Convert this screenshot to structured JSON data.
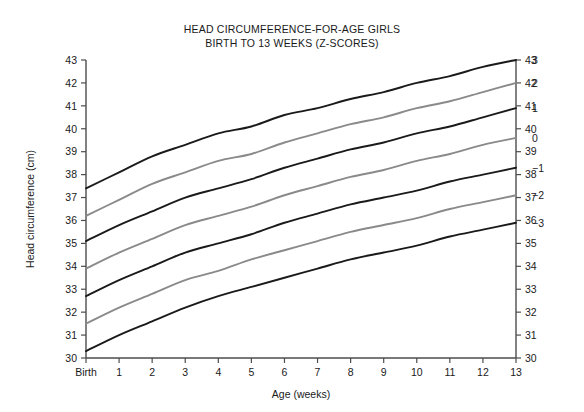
{
  "chart_data": {
    "type": "line",
    "title": "HEAD CIRCUMFERENCE-FOR-AGE GIRLS",
    "subtitle": "BIRTH TO 13 WEEKS (Z-SCORES)",
    "xlabel": "Age (weeks)",
    "ylabel": "Head circumference (cm)",
    "ylabel_right": "",
    "grid": false,
    "legend_position": "right-curve-ends",
    "xlim": [
      0,
      13
    ],
    "ylim": [
      30,
      43
    ],
    "x_tick_labels": [
      "Birth",
      "1",
      "2",
      "3",
      "4",
      "5",
      "6",
      "7",
      "8",
      "9",
      "10",
      "11",
      "12",
      "13"
    ],
    "x": [
      0,
      1,
      2,
      3,
      4,
      5,
      6,
      7,
      8,
      9,
      10,
      11,
      12,
      13
    ],
    "y_tick_labels": [
      "30",
      "31",
      "32",
      "33",
      "34",
      "35",
      "36",
      "37",
      "38",
      "39",
      "40",
      "41",
      "42",
      "43"
    ],
    "y_ticks": [
      30,
      31,
      32,
      33,
      34,
      35,
      36,
      37,
      38,
      39,
      40,
      41,
      42,
      43
    ],
    "y_tick_labels_right": [
      "30",
      "31",
      "32",
      "33",
      "34",
      "35",
      "36",
      "37",
      "38",
      "39",
      "40",
      "41",
      "42",
      "43"
    ],
    "series": [
      {
        "name": "3",
        "label": "3",
        "color": "#1a1a1a",
        "values": [
          37.4,
          38.1,
          38.8,
          39.3,
          39.8,
          40.1,
          40.6,
          40.9,
          41.3,
          41.6,
          42.0,
          42.3,
          42.7,
          43.0
        ]
      },
      {
        "name": "2",
        "label": "2",
        "color": "#8a8a8a",
        "values": [
          36.2,
          36.9,
          37.6,
          38.1,
          38.6,
          38.9,
          39.4,
          39.8,
          40.2,
          40.5,
          40.9,
          41.2,
          41.6,
          42.0
        ]
      },
      {
        "name": "1",
        "label": "1",
        "color": "#1a1a1a",
        "values": [
          35.1,
          35.8,
          36.4,
          37.0,
          37.4,
          37.8,
          38.3,
          38.7,
          39.1,
          39.4,
          39.8,
          40.1,
          40.5,
          40.9
        ]
      },
      {
        "name": "0",
        "label": "0",
        "color": "#8a8a8a",
        "values": [
          33.9,
          34.6,
          35.2,
          35.8,
          36.2,
          36.6,
          37.1,
          37.5,
          37.9,
          38.2,
          38.6,
          38.9,
          39.3,
          39.6
        ]
      },
      {
        "name": "-1",
        "label": "−1",
        "color": "#1a1a1a",
        "values": [
          32.7,
          33.4,
          34.0,
          34.6,
          35.0,
          35.4,
          35.9,
          36.3,
          36.7,
          37.0,
          37.3,
          37.7,
          38.0,
          38.3
        ]
      },
      {
        "name": "-2",
        "label": "−2",
        "color": "#8a8a8a",
        "values": [
          31.5,
          32.2,
          32.8,
          33.4,
          33.8,
          34.3,
          34.7,
          35.1,
          35.5,
          35.8,
          36.1,
          36.5,
          36.8,
          37.1
        ]
      },
      {
        "name": "-3",
        "label": "−3",
        "color": "#1a1a1a",
        "values": [
          30.3,
          31.0,
          31.6,
          32.2,
          32.7,
          33.1,
          33.5,
          33.9,
          34.3,
          34.6,
          34.9,
          35.3,
          35.6,
          35.9
        ]
      }
    ]
  },
  "colors": {
    "background": "#ffffff",
    "axis": "#4d4d4d",
    "text": "#1a1a1a",
    "curve_dark": "#1a1a1a",
    "curve_light": "#8a8a8a"
  }
}
